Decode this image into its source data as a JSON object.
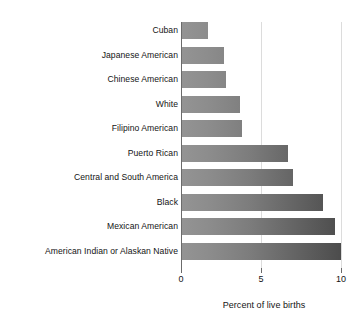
{
  "chart_data": {
    "type": "bar",
    "orientation": "horizontal",
    "title": "",
    "subtitle": "",
    "xlabel": "Percent of live births",
    "ylabel": "",
    "xlim": [
      0,
      10.6
    ],
    "xticks": [
      0,
      5,
      10
    ],
    "xtick_labels": [
      "0",
      "5",
      "10"
    ],
    "grid": "vertical gridlines at 5 and 10",
    "legend": "none",
    "bar_style": "horizontal gray gradient, light at left to dark at right",
    "categories": [
      "Cuban",
      "Japanese American",
      "Chinese American",
      "White",
      "Filipino American",
      "Puerto Rican",
      "Central and South America",
      "Black",
      "Mexican American",
      "American Indian or Alaskan Native"
    ],
    "values": [
      1.7,
      2.7,
      2.8,
      3.7,
      3.8,
      6.7,
      7.0,
      8.9,
      9.6,
      10.2
    ],
    "bars": [
      {
        "label": "Cuban",
        "value": 1.7
      },
      {
        "label": "Japanese American",
        "value": 2.7
      },
      {
        "label": "Chinese American",
        "value": 2.8
      },
      {
        "label": "White",
        "value": 3.7
      },
      {
        "label": "Filipino American",
        "value": 3.8
      },
      {
        "label": "Puerto Rican",
        "value": 6.7
      },
      {
        "label": "Central and South America",
        "value": 7.0
      },
      {
        "label": "Black",
        "value": 8.9
      },
      {
        "label": "Mexican American",
        "value": 9.6
      },
      {
        "label": "American Indian or Alaskan Native",
        "value": 10.2
      }
    ]
  },
  "colors": {
    "background": "#ffffff",
    "bar_light": "#949494",
    "bar_dark": "#4c4c4c",
    "gridline": "#dcdcdc",
    "axis": "#6b6b6b",
    "text": "#141414"
  }
}
